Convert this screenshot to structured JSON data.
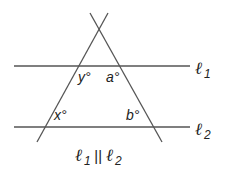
{
  "diagram": {
    "colors": {
      "line": "#555555",
      "text": "#222222"
    },
    "lines": {
      "l1": {
        "label": "ℓ",
        "sub": "1",
        "y": 66
      },
      "l2": {
        "label": "ℓ",
        "sub": "2",
        "y": 127
      }
    },
    "angles": {
      "y": "y°",
      "a": "a°",
      "x": "x°",
      "b": "b°"
    },
    "caption": {
      "l1": "ℓ",
      "sub1": "1",
      "parallel": "||",
      "l2": "ℓ",
      "sub2": "2"
    }
  }
}
